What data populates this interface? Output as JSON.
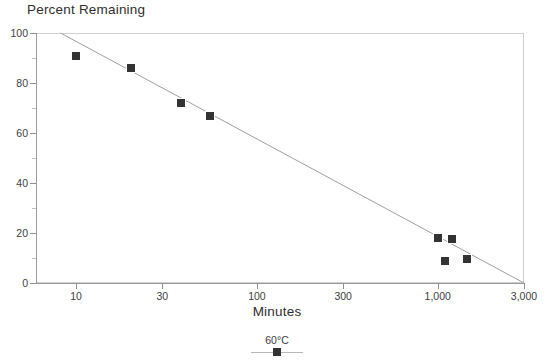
{
  "chart_data": {
    "type": "scatter",
    "title": "",
    "ylabel": "Percent Remaining",
    "xlabel": "Minutes",
    "xscale": "log",
    "yscale": "linear",
    "xlim": [
      6,
      3000
    ],
    "ylim": [
      0,
      100
    ],
    "grid": false,
    "frame": true,
    "legend_position": "bottom-center",
    "x_ticks": [
      {
        "value": 10,
        "label": "10"
      },
      {
        "value": 30,
        "label": "30"
      },
      {
        "value": 100,
        "label": "100"
      },
      {
        "value": 300,
        "label": "300"
      },
      {
        "value": 1000,
        "label": "1,000"
      },
      {
        "value": 3000,
        "label": "3,000"
      }
    ],
    "y_ticks_major": [
      {
        "value": 0,
        "label": "0"
      },
      {
        "value": 20,
        "label": "20"
      },
      {
        "value": 40,
        "label": "40"
      },
      {
        "value": 60,
        "label": "60"
      },
      {
        "value": 80,
        "label": "80"
      },
      {
        "value": 100,
        "label": "100"
      }
    ],
    "y_ticks_minor": [
      10,
      30,
      50,
      70,
      90
    ],
    "series": [
      {
        "name": "60°C",
        "marker": "square",
        "marker_color": "#333333",
        "line_color": "#9e9e9e",
        "x": [
          10,
          20,
          38,
          55,
          1000,
          1200,
          1100,
          1450
        ],
        "y": [
          91,
          86,
          72,
          67,
          18,
          17.8,
          9,
          9.5
        ],
        "points": [
          {
            "x": 10,
            "y": 91
          },
          {
            "x": 20,
            "y": 86
          },
          {
            "x": 38,
            "y": 72
          },
          {
            "x": 55,
            "y": 67
          },
          {
            "x": 1000,
            "y": 18
          },
          {
            "x": 1200,
            "y": 17.8
          },
          {
            "x": 1100,
            "y": 9
          },
          {
            "x": 1450,
            "y": 9.5
          }
        ]
      }
    ],
    "fit_line": {
      "name": "regression",
      "color": "#9e9e9e",
      "x_start": 8.2,
      "y_start": 100,
      "x_end": 3000,
      "y_end": 0
    },
    "legend": [
      {
        "label": "60°C",
        "marker": "square",
        "marker_color": "#333333",
        "line_color": "#b8b8b8"
      }
    ]
  },
  "colors": {
    "marker": "#333333",
    "fit_line": "#9e9e9e",
    "axis": "#8f8f8f",
    "frame": "#cfcfcf",
    "text": "#3d3d3d",
    "background": "#ffffff"
  }
}
